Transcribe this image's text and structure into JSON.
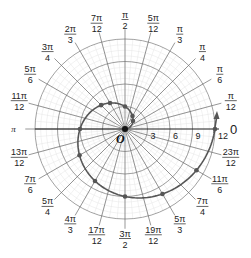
{
  "chart_data": {
    "type": "line",
    "subtype": "polar",
    "title": "",
    "equation_note": "Archimedean spiral r = 6θ/π, 0 ≤ θ ≤ 2π",
    "r_ticks": [
      3,
      6,
      9,
      12
    ],
    "rlim": [
      0,
      12
    ],
    "origin_label": "O",
    "theta_axis_label": "0",
    "angle_labels": [
      {
        "angle_deg": 15,
        "num": "π",
        "den": "12"
      },
      {
        "angle_deg": 30,
        "num": "π",
        "den": "6"
      },
      {
        "angle_deg": 45,
        "num": "π",
        "den": "4"
      },
      {
        "angle_deg": 60,
        "num": "π",
        "den": "3"
      },
      {
        "angle_deg": 75,
        "num": "5π",
        "den": "12"
      },
      {
        "angle_deg": 90,
        "num": "π",
        "den": "2"
      },
      {
        "angle_deg": 105,
        "num": "7π",
        "den": "12"
      },
      {
        "angle_deg": 120,
        "num": "2π",
        "den": "3"
      },
      {
        "angle_deg": 135,
        "num": "3π",
        "den": "4"
      },
      {
        "angle_deg": 150,
        "num": "5π",
        "den": "6"
      },
      {
        "angle_deg": 165,
        "num": "11π",
        "den": "12"
      },
      {
        "angle_deg": 180,
        "num": "π",
        "den": ""
      },
      {
        "angle_deg": 195,
        "num": "13π",
        "den": "12"
      },
      {
        "angle_deg": 210,
        "num": "7π",
        "den": "6"
      },
      {
        "angle_deg": 225,
        "num": "5π",
        "den": "4"
      },
      {
        "angle_deg": 240,
        "num": "4π",
        "den": "3"
      },
      {
        "angle_deg": 255,
        "num": "17π",
        "den": "12"
      },
      {
        "angle_deg": 270,
        "num": "3π",
        "den": "2"
      },
      {
        "angle_deg": 285,
        "num": "19π",
        "den": "12"
      },
      {
        "angle_deg": 300,
        "num": "5π",
        "den": "3"
      },
      {
        "angle_deg": 315,
        "num": "7π",
        "den": "4"
      },
      {
        "angle_deg": 330,
        "num": "11π",
        "den": "6"
      },
      {
        "angle_deg": 345,
        "num": "23π",
        "den": "12"
      }
    ],
    "series": [
      {
        "name": "spiral",
        "color": "#555555",
        "theta_deg": [
          0,
          30,
          45,
          60,
          90,
          120,
          135,
          150,
          180,
          210,
          240,
          270,
          300,
          330,
          360
        ],
        "r": [
          0,
          1,
          1.5,
          2,
          3,
          4,
          4.5,
          5,
          6,
          7,
          8,
          9,
          10,
          11,
          12
        ],
        "markers_theta_deg": [
          45,
          60,
          90,
          120,
          135,
          180,
          210,
          240,
          270,
          300,
          330,
          360
        ]
      }
    ],
    "grid": true,
    "arrow_at_end": true
  }
}
